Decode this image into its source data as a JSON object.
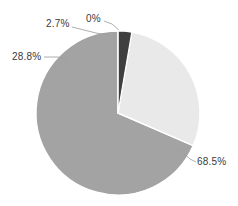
{
  "chart_data": {
    "type": "pie",
    "title": "",
    "subtitle": "",
    "xlabel": "",
    "ylabel": "",
    "legend": "none",
    "grid": false,
    "background_color": "#ffffff",
    "label_text_color": "#3a3a3a",
    "leader_line_color": "#9a9a9a",
    "slice_border_color": "#ffffff",
    "start_angle_deg": 0,
    "direction": "clockwise",
    "categories": [
      "0%",
      "2.7%",
      "28.8%",
      "68.5%"
    ],
    "values": [
      0.0,
      2.7,
      28.8,
      68.5
    ],
    "labels": [
      "0%",
      "2.7%",
      "28.8%",
      "68.5%"
    ],
    "colors": [
      "#fdfdfd",
      "#3f3f3f",
      "#e9e9e9",
      "#a3a3a3"
    ],
    "slices": [
      {
        "label": "0%",
        "value": 0.0,
        "color": "#fdfdfd",
        "label_position": "top"
      },
      {
        "label": "2.7%",
        "value": 2.7,
        "color": "#3f3f3f",
        "label_position": "top-left"
      },
      {
        "label": "28.8%",
        "value": 28.8,
        "color": "#e9e9e9",
        "label_position": "left"
      },
      {
        "label": "68.5%",
        "value": 68.5,
        "color": "#a3a3a3",
        "label_position": "bottom-right"
      }
    ]
  }
}
